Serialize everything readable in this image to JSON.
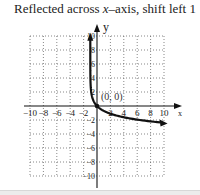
{
  "caption": {
    "prefix": "Reflected across ",
    "var": "x",
    "suffix": "–axis, shift left 1"
  },
  "axes": {
    "x_label": "x",
    "y_label": "y",
    "x_ticks": [
      "−10",
      "−8",
      "−6",
      "−4",
      "−2",
      "2",
      "4",
      "6",
      "8",
      "10"
    ],
    "y_ticks": [
      "10",
      "8",
      "6",
      "4",
      "2",
      "−2",
      "−4",
      "−6",
      "−8",
      "−10"
    ]
  },
  "annotation": "(0, 0)",
  "colors": {
    "curve": "#111111",
    "grid": "#555555",
    "axis": "#111111"
  },
  "chart_data": {
    "type": "line",
    "title": "Reflected across x–axis, shift left 1",
    "function": "y = -ln(x + 1)",
    "xlabel": "x",
    "ylabel": "y",
    "xlim": [
      -10,
      10
    ],
    "ylim": [
      -10,
      10
    ],
    "grid": true,
    "x_ticks": [
      -10,
      -8,
      -6,
      -4,
      -2,
      2,
      4,
      6,
      8,
      10
    ],
    "y_ticks": [
      -10,
      -8,
      -6,
      -4,
      -2,
      2,
      4,
      6,
      8,
      10
    ],
    "series": [
      {
        "name": "y = -ln(x+1)",
        "x": [
          -0.9999,
          -0.999,
          -0.99,
          -0.95,
          -0.9,
          -0.8,
          -0.6,
          -0.4,
          0,
          1,
          2,
          4,
          6,
          8,
          10
        ],
        "y": [
          9.2,
          6.9,
          4.6,
          3.0,
          2.3,
          1.61,
          0.92,
          0.51,
          0,
          -0.69,
          -1.1,
          -1.61,
          -1.95,
          -2.2,
          -2.4
        ]
      }
    ],
    "annotations": [
      {
        "text": "(0, 0)",
        "x": 0,
        "y": 0
      }
    ],
    "asymptote": {
      "type": "vertical",
      "x": -1
    }
  }
}
